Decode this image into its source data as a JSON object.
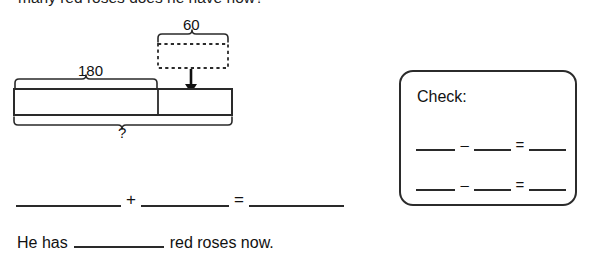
{
  "worksheet": {
    "question_text": "many red roses does he have now?",
    "bar_model": {
      "whole_label": "180",
      "part_label": "60",
      "unknown_label": "?",
      "name": "bar-model-diagram"
    },
    "equation": {
      "blank_1": "",
      "operator_plus": "+",
      "blank_2": "",
      "operator_equals": "=",
      "blank_3": ""
    },
    "sentence": {
      "prefix": "He has",
      "blank": "",
      "suffix": "red roses now."
    },
    "check": {
      "title": "Check:",
      "rows": [
        {
          "blank_1": "",
          "minus": "–",
          "blank_2": "",
          "equals": "=",
          "blank_3": ""
        },
        {
          "blank_1": "",
          "minus": "–",
          "blank_2": "",
          "equals": "=",
          "blank_3": ""
        }
      ]
    },
    "colors": {
      "ink": "#1a1a1a",
      "line": "#2a2a2a",
      "paper": "#ffffff"
    }
  }
}
